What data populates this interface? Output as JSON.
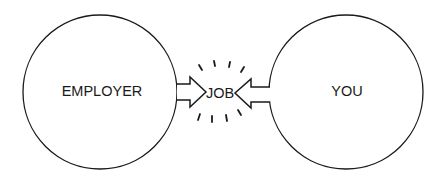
{
  "diagram": {
    "left_circle": {
      "label": "EMPLOYER",
      "cx": 100,
      "cy": 92,
      "r": 77
    },
    "right_circle": {
      "label": "YOU",
      "cx": 346,
      "cy": 92,
      "r": 77
    },
    "center": {
      "label": "JOB",
      "x": 220,
      "y": 93
    },
    "stroke_color": "#1a1a1a",
    "background": "#ffffff"
  }
}
